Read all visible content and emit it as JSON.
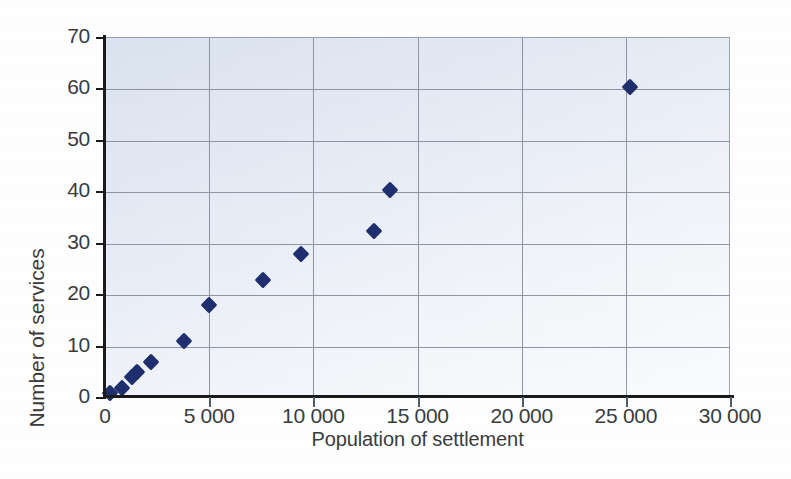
{
  "chart_data": {
    "type": "scatter",
    "title": "",
    "xlabel": "Population of settlement",
    "ylabel": "Number of services",
    "xlim": [
      0,
      30000
    ],
    "ylim": [
      0,
      70
    ],
    "grid": true,
    "legend": false,
    "marker": {
      "shape": "diamond",
      "color": "#1f2f6e",
      "size": 12
    },
    "plot_background": "#e7ecf6",
    "gridline_color": "#8f96a3",
    "axis_color": "#1a1a1a",
    "xticks": [
      0,
      5000,
      10000,
      15000,
      20000,
      25000,
      30000
    ],
    "xtick_labels": [
      "0",
      "5 000",
      "10 000",
      "15 000",
      "20 000",
      "25 000",
      "30 000"
    ],
    "yticks": [
      0,
      10,
      20,
      30,
      40,
      50,
      60,
      70
    ],
    "ytick_labels": [
      "0",
      "10",
      "20",
      "30",
      "40",
      "50",
      "60",
      "70"
    ],
    "points": [
      {
        "x": 250,
        "y": 1
      },
      {
        "x": 800,
        "y": 2
      },
      {
        "x": 1300,
        "y": 4
      },
      {
        "x": 1550,
        "y": 5
      },
      {
        "x": 2200,
        "y": 7
      },
      {
        "x": 3800,
        "y": 11
      },
      {
        "x": 5000,
        "y": 18
      },
      {
        "x": 7600,
        "y": 23
      },
      {
        "x": 9400,
        "y": 28
      },
      {
        "x": 12900,
        "y": 32.5
      },
      {
        "x": 13700,
        "y": 40.5
      },
      {
        "x": 25200,
        "y": 60.5
      }
    ]
  }
}
